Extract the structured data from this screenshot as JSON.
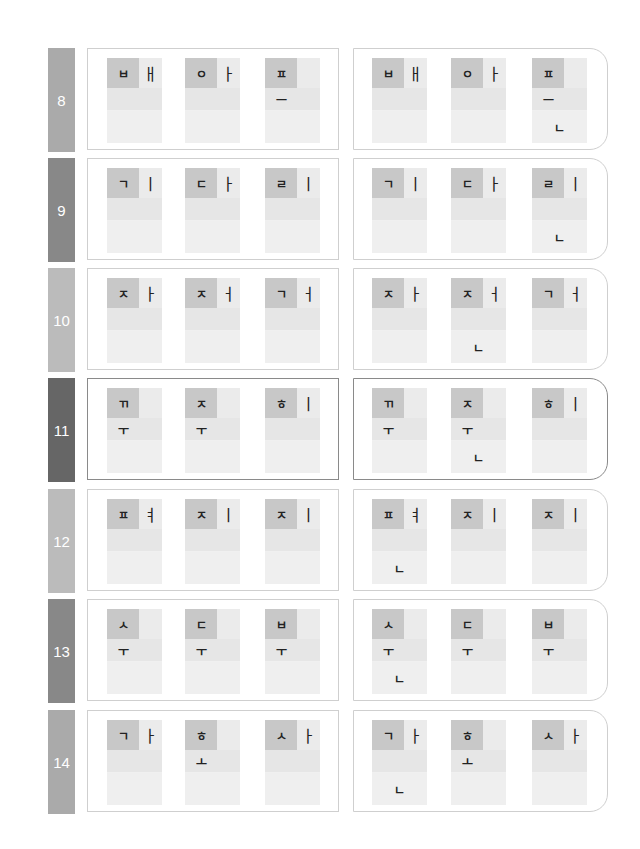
{
  "colors": {
    "tab_8": "#aaaaaa",
    "tab_9": "#888888",
    "tab_10": "#bbbbbb",
    "tab_11": "#666666",
    "tab_12": "#bbbbbb",
    "tab_13": "#888888",
    "tab_14": "#aaaaaa",
    "initial_block": "#c8c8c8",
    "cell_bg": "#f0f0f0",
    "panel_border": "#cfcfcf"
  },
  "rows": [
    {
      "number": "8",
      "left": [
        {
          "initial": "ㅂ",
          "vowel_right": "ㅐ",
          "vowel_bottom": "",
          "final": ""
        },
        {
          "initial": "ㅇ",
          "vowel_right": "ㅏ",
          "vowel_bottom": "",
          "final": ""
        },
        {
          "initial": "ㅍ",
          "vowel_right": "",
          "vowel_bottom": "ㅡ",
          "final": ""
        }
      ],
      "right": [
        {
          "initial": "ㅂ",
          "vowel_right": "ㅐ",
          "vowel_bottom": "",
          "final": ""
        },
        {
          "initial": "ㅇ",
          "vowel_right": "ㅏ",
          "vowel_bottom": "",
          "final": ""
        },
        {
          "initial": "ㅍ",
          "vowel_right": "",
          "vowel_bottom": "ㅡ",
          "final": "ㄴ"
        }
      ]
    },
    {
      "number": "9",
      "left": [
        {
          "initial": "ㄱ",
          "vowel_right": "ㅣ",
          "vowel_bottom": "",
          "final": ""
        },
        {
          "initial": "ㄷ",
          "vowel_right": "ㅏ",
          "vowel_bottom": "",
          "final": ""
        },
        {
          "initial": "ㄹ",
          "vowel_right": "ㅣ",
          "vowel_bottom": "",
          "final": ""
        }
      ],
      "right": [
        {
          "initial": "ㄱ",
          "vowel_right": "ㅣ",
          "vowel_bottom": "",
          "final": ""
        },
        {
          "initial": "ㄷ",
          "vowel_right": "ㅏ",
          "vowel_bottom": "",
          "final": ""
        },
        {
          "initial": "ㄹ",
          "vowel_right": "ㅣ",
          "vowel_bottom": "",
          "final": "ㄴ"
        }
      ]
    },
    {
      "number": "10",
      "left": [
        {
          "initial": "ㅈ",
          "vowel_right": "ㅏ",
          "vowel_bottom": "",
          "final": ""
        },
        {
          "initial": "ㅈ",
          "vowel_right": "ㅓ",
          "vowel_bottom": "",
          "final": ""
        },
        {
          "initial": "ㄱ",
          "vowel_right": "ㅓ",
          "vowel_bottom": "",
          "final": ""
        }
      ],
      "right": [
        {
          "initial": "ㅈ",
          "vowel_right": "ㅏ",
          "vowel_bottom": "",
          "final": ""
        },
        {
          "initial": "ㅈ",
          "vowel_right": "ㅓ",
          "vowel_bottom": "",
          "final": "ㄴ"
        },
        {
          "initial": "ㄱ",
          "vowel_right": "ㅓ",
          "vowel_bottom": "",
          "final": ""
        }
      ]
    },
    {
      "number": "11",
      "left": [
        {
          "initial": "ㄲ",
          "vowel_right": "",
          "vowel_bottom": "ㅜ",
          "final": ""
        },
        {
          "initial": "ㅈ",
          "vowel_right": "",
          "vowel_bottom": "ㅜ",
          "final": ""
        },
        {
          "initial": "ㅎ",
          "vowel_right": "ㅣ",
          "vowel_bottom": "",
          "final": ""
        }
      ],
      "right": [
        {
          "initial": "ㄲ",
          "vowel_right": "",
          "vowel_bottom": "ㅜ",
          "final": ""
        },
        {
          "initial": "ㅈ",
          "vowel_right": "",
          "vowel_bottom": "ㅜ",
          "final": "ㄴ"
        },
        {
          "initial": "ㅎ",
          "vowel_right": "ㅣ",
          "vowel_bottom": "",
          "final": ""
        }
      ]
    },
    {
      "number": "12",
      "left": [
        {
          "initial": "ㅍ",
          "vowel_right": "ㅕ",
          "vowel_bottom": "",
          "final": ""
        },
        {
          "initial": "ㅈ",
          "vowel_right": "ㅣ",
          "vowel_bottom": "",
          "final": ""
        },
        {
          "initial": "ㅈ",
          "vowel_right": "ㅣ",
          "vowel_bottom": "",
          "final": ""
        }
      ],
      "right": [
        {
          "initial": "ㅍ",
          "vowel_right": "ㅕ",
          "vowel_bottom": "",
          "final": "ㄴ"
        },
        {
          "initial": "ㅈ",
          "vowel_right": "ㅣ",
          "vowel_bottom": "",
          "final": ""
        },
        {
          "initial": "ㅈ",
          "vowel_right": "ㅣ",
          "vowel_bottom": "",
          "final": ""
        }
      ]
    },
    {
      "number": "13",
      "left": [
        {
          "initial": "ㅅ",
          "vowel_right": "",
          "vowel_bottom": "ㅜ",
          "final": ""
        },
        {
          "initial": "ㄷ",
          "vowel_right": "",
          "vowel_bottom": "ㅜ",
          "final": ""
        },
        {
          "initial": "ㅂ",
          "vowel_right": "",
          "vowel_bottom": "ㅜ",
          "final": ""
        }
      ],
      "right": [
        {
          "initial": "ㅅ",
          "vowel_right": "",
          "vowel_bottom": "ㅜ",
          "final": "ㄴ"
        },
        {
          "initial": "ㄷ",
          "vowel_right": "",
          "vowel_bottom": "ㅜ",
          "final": ""
        },
        {
          "initial": "ㅂ",
          "vowel_right": "",
          "vowel_bottom": "ㅜ",
          "final": ""
        }
      ]
    },
    {
      "number": "14",
      "left": [
        {
          "initial": "ㄱ",
          "vowel_right": "ㅏ",
          "vowel_bottom": "",
          "final": ""
        },
        {
          "initial": "ㅎ",
          "vowel_right": "",
          "vowel_bottom": "ㅗ",
          "final": ""
        },
        {
          "initial": "ㅅ",
          "vowel_right": "ㅏ",
          "vowel_bottom": "",
          "final": ""
        }
      ],
      "right": [
        {
          "initial": "ㄱ",
          "vowel_right": "ㅏ",
          "vowel_bottom": "",
          "final": "ㄴ"
        },
        {
          "initial": "ㅎ",
          "vowel_right": "",
          "vowel_bottom": "ㅗ",
          "final": ""
        },
        {
          "initial": "ㅅ",
          "vowel_right": "ㅏ",
          "vowel_bottom": "",
          "final": ""
        }
      ]
    }
  ]
}
